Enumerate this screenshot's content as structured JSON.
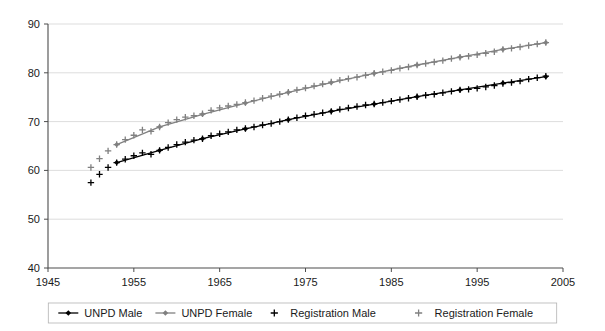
{
  "chart_data": {
    "type": "line",
    "title": "",
    "subtitle": "",
    "xlabel": "",
    "ylabel": "",
    "xlim": [
      1945,
      2005
    ],
    "ylim": [
      40,
      90
    ],
    "xticks": [
      1945,
      1955,
      1965,
      1975,
      1985,
      1995,
      2005
    ],
    "yticks": [
      40,
      50,
      60,
      70,
      80,
      90
    ],
    "grid": true,
    "legend_position": "bottom",
    "series": [
      {
        "name": "UNPD Male",
        "marker": "diamond",
        "color": "#000000",
        "style": "line-marker",
        "x": [
          1953,
          1958,
          1963,
          1968,
          1973,
          1978,
          1983,
          1988,
          1993,
          1998,
          2003
        ],
        "values": [
          61.6,
          64.1,
          66.5,
          68.5,
          70.4,
          72.1,
          73.6,
          75.1,
          76.5,
          77.9,
          79.2
        ]
      },
      {
        "name": "UNPD Female",
        "marker": "diamond",
        "color": "#808080",
        "style": "line-marker",
        "x": [
          1953,
          1958,
          1963,
          1968,
          1973,
          1978,
          1983,
          1988,
          1993,
          1998,
          2003
        ],
        "values": [
          65.3,
          68.9,
          71.5,
          73.8,
          76.0,
          78.0,
          79.9,
          81.6,
          83.2,
          84.8,
          86.2
        ]
      },
      {
        "name": "Registration Male",
        "marker": "plus",
        "color": "#000000",
        "style": "marker-only",
        "x": [
          1950,
          1951,
          1952,
          1953,
          1954,
          1955,
          1956,
          1957,
          1958,
          1959,
          1960,
          1961,
          1962,
          1963,
          1964,
          1965,
          1966,
          1967,
          1968,
          1969,
          1970,
          1971,
          1972,
          1973,
          1974,
          1975,
          1976,
          1977,
          1978,
          1979,
          1980,
          1981,
          1982,
          1983,
          1984,
          1985,
          1986,
          1987,
          1988,
          1989,
          1990,
          1991,
          1992,
          1993,
          1994,
          1995,
          1996,
          1997,
          1998,
          1999,
          2000,
          2001,
          2002,
          2003
        ],
        "values": [
          57.5,
          59.2,
          60.6,
          61.6,
          62.3,
          63.0,
          63.6,
          63.3,
          64.1,
          64.7,
          65.3,
          65.8,
          66.2,
          66.5,
          67.1,
          67.5,
          67.9,
          68.3,
          68.6,
          68.9,
          69.3,
          69.6,
          70.0,
          70.4,
          70.8,
          71.2,
          71.5,
          71.8,
          72.1,
          72.5,
          72.8,
          73.1,
          73.4,
          73.6,
          73.9,
          74.2,
          74.5,
          74.8,
          75.1,
          75.4,
          75.6,
          75.9,
          76.2,
          76.5,
          76.6,
          76.8,
          77.1,
          77.4,
          77.8,
          78.0,
          78.3,
          78.7,
          79.0,
          79.3
        ]
      },
      {
        "name": "Registration Female",
        "marker": "plus",
        "color": "#808080",
        "style": "marker-only",
        "x": [
          1950,
          1951,
          1952,
          1953,
          1954,
          1955,
          1956,
          1957,
          1958,
          1959,
          1960,
          1961,
          1962,
          1963,
          1964,
          1965,
          1966,
          1967,
          1968,
          1969,
          1970,
          1971,
          1972,
          1973,
          1974,
          1975,
          1976,
          1977,
          1978,
          1979,
          1980,
          1981,
          1982,
          1983,
          1984,
          1985,
          1986,
          1987,
          1988,
          1989,
          1990,
          1991,
          1992,
          1993,
          1994,
          1995,
          1996,
          1997,
          1998,
          1999,
          2000,
          2001,
          2002,
          2003
        ],
        "values": [
          60.6,
          62.4,
          64.0,
          65.3,
          66.3,
          67.2,
          68.3,
          68.0,
          68.9,
          69.8,
          70.4,
          70.9,
          71.2,
          71.6,
          72.3,
          72.8,
          73.2,
          73.5,
          73.9,
          74.3,
          74.8,
          75.2,
          75.6,
          76.0,
          76.5,
          76.9,
          77.3,
          77.7,
          78.1,
          78.5,
          78.8,
          79.1,
          79.5,
          79.9,
          80.2,
          80.5,
          80.9,
          81.2,
          81.6,
          81.9,
          82.2,
          82.5,
          82.9,
          83.2,
          83.4,
          83.7,
          84.0,
          84.3,
          84.8,
          85.0,
          85.3,
          85.6,
          85.9,
          86.2
        ]
      }
    ]
  },
  "axes": {
    "y_tick_labels": [
      "90",
      "80",
      "70",
      "60",
      "50",
      "40"
    ],
    "x_tick_labels": [
      "1945",
      "1955",
      "1965",
      "1975",
      "1985",
      "1995",
      "2005"
    ]
  },
  "legend": {
    "items": [
      {
        "label": "UNPD Male",
        "marker": "line-diamond",
        "color": "#000000"
      },
      {
        "label": "UNPD Female",
        "marker": "line-diamond",
        "color": "#808080"
      },
      {
        "label": "Registration Male",
        "marker": "plus",
        "color": "#000000"
      },
      {
        "label": "Registration Female",
        "marker": "plus",
        "color": "#808080"
      }
    ]
  },
  "colors": {
    "male": "#000000",
    "female": "#808080",
    "grid": "#d9d9d9",
    "axis": "#4d4d4d",
    "background": "#ffffff"
  }
}
